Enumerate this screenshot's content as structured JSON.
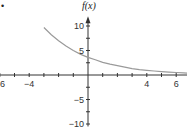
{
  "chart_data": {
    "type": "line",
    "title": "",
    "xlabel": "x",
    "ylabel": "f(x)",
    "xlim": [
      -7.3,
      7.5
    ],
    "ylim": [
      -10.5,
      12
    ],
    "x_ticks": [
      -6,
      -4,
      4,
      6
    ],
    "x_tick_labels": [
      "−6",
      "−4",
      "4",
      "6"
    ],
    "x_minor_ticks": [
      -7,
      -5,
      -3,
      -2,
      -1,
      1,
      2,
      3,
      5,
      7
    ],
    "y_ticks": [
      10,
      5,
      -5,
      -10
    ],
    "y_tick_labels": [
      "10",
      "5",
      "−5",
      "−10"
    ],
    "y_minor_ticks": [
      7.5,
      2.5,
      -2.5,
      -7.5
    ],
    "grid": false,
    "legend": null,
    "series": [
      {
        "name": "f(x)",
        "color": "#9a9a9a",
        "description": "exponential decay curve",
        "x": [
          -3,
          -2.5,
          -2,
          -1.5,
          -1,
          -0.5,
          0,
          0.5,
          1,
          1.5,
          2,
          2.5,
          3,
          3.5,
          4,
          4.5,
          5,
          5.5,
          6,
          6.5,
          7
        ],
        "values": [
          9.7,
          8.2,
          7.0,
          5.9,
          5.0,
          4.2,
          3.6,
          3.1,
          2.6,
          2.2,
          1.9,
          1.6,
          1.3,
          1.1,
          0.96,
          0.82,
          0.69,
          0.59,
          0.5,
          0.42,
          0.36
        ]
      }
    ]
  },
  "marker": {
    "bullet": "•"
  },
  "colors": {
    "axis": "#333333",
    "curve": "#9a9a9a"
  }
}
